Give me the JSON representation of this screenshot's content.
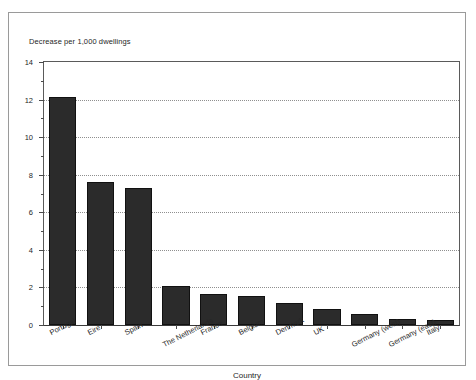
{
  "figure": {
    "border_color": "#9a9a9a",
    "background": "#ffffff",
    "bar_color": "#2b2b2b",
    "grid_color": "#8f8f8f"
  },
  "chart_data": {
    "type": "bar",
    "title": "",
    "ylabel": "Decrease per 1,000 dwellings",
    "xlabel": "Country",
    "categories": [
      "Portugal",
      "Eire",
      "Spain",
      "The Netherlands",
      "France",
      "Belgium",
      "Denmark",
      "UK",
      "Germany (west)",
      "Germany (east)",
      "Italy"
    ],
    "values": [
      12.15,
      7.6,
      7.3,
      2.1,
      1.65,
      1.55,
      1.15,
      0.85,
      0.6,
      0.3,
      0.25
    ],
    "ylim": [
      0,
      14
    ],
    "ytick_values": [
      0,
      2,
      4,
      6,
      8,
      10,
      12,
      14
    ],
    "ytick_labels": [
      "0",
      "2",
      "4",
      "6",
      "8",
      "10",
      "12",
      "14"
    ],
    "yminor_values": [
      1,
      3,
      5,
      7,
      9,
      11,
      13
    ],
    "gridline_values": [
      2,
      4,
      6,
      8,
      10,
      12
    ],
    "grid": "horizontal-dotted",
    "legend": "none"
  }
}
